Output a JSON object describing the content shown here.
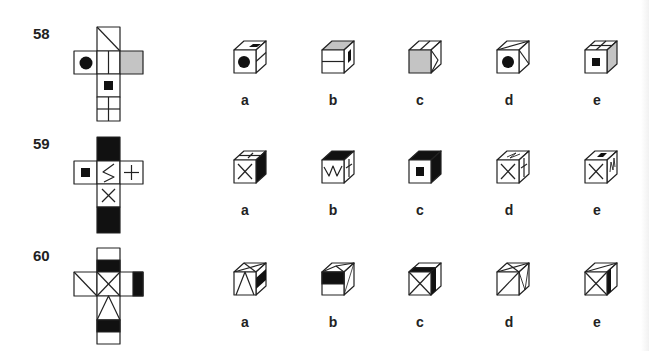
{
  "colors": {
    "line": "#222222",
    "black": "#111111",
    "gray": "#c4c4c4",
    "bg": "#ffffff"
  },
  "questions": [
    {
      "number": "58",
      "net": {
        "faces": [
          {
            "pos": "top",
            "pattern": "diagonal-tl-br"
          },
          {
            "pos": "left",
            "pattern": "black-circle"
          },
          {
            "pos": "center",
            "pattern": "vertical-split"
          },
          {
            "pos": "right",
            "pattern": "gray-fill"
          },
          {
            "pos": "below",
            "pattern": "black-square"
          },
          {
            "pos": "bottom",
            "pattern": "four-grid"
          }
        ]
      },
      "options": [
        {
          "label": "a",
          "front": "black-circle",
          "top": "black-square",
          "side": "horizontal-split"
        },
        {
          "label": "b",
          "front": "horizontal-split",
          "top": "gray-fill",
          "side": "black-square"
        },
        {
          "label": "c",
          "front": "gray-fill",
          "top": "vertical-split",
          "side": "diagonal-triangle"
        },
        {
          "label": "d",
          "front": "black-circle",
          "top": "diagonal",
          "side": "diagonal"
        },
        {
          "label": "e",
          "front": "black-square",
          "top": "vertical-split",
          "side": "gray-fill"
        }
      ]
    },
    {
      "number": "59",
      "net": {
        "faces": [
          {
            "pos": "top",
            "pattern": "black-fill"
          },
          {
            "pos": "left",
            "pattern": "black-square"
          },
          {
            "pos": "center",
            "pattern": "zigzag"
          },
          {
            "pos": "right",
            "pattern": "plus"
          },
          {
            "pos": "below",
            "pattern": "x-cross"
          },
          {
            "pos": "bottom",
            "pattern": "black-fill"
          }
        ]
      },
      "options": [
        {
          "label": "a",
          "front": "x-cross",
          "top": "plus",
          "side": "black-fill"
        },
        {
          "label": "b",
          "front": "zigzag",
          "top": "black-fill",
          "side": "plus"
        },
        {
          "label": "c",
          "front": "black-square",
          "top": "black-fill",
          "side": "black-fill"
        },
        {
          "label": "d",
          "front": "x-cross",
          "top": "zigzag",
          "side": "plus"
        },
        {
          "label": "e",
          "front": "x-cross",
          "top": "black-square",
          "side": "zigzag"
        }
      ]
    },
    {
      "number": "60",
      "net": {
        "faces": [
          {
            "pos": "top",
            "pattern": "black-lower-half"
          },
          {
            "pos": "left",
            "pattern": "diagonal-tl-br"
          },
          {
            "pos": "center",
            "pattern": "x-cross"
          },
          {
            "pos": "right",
            "pattern": "black-right-half"
          },
          {
            "pos": "below",
            "pattern": "triangle"
          },
          {
            "pos": "bottom",
            "pattern": "black-upper-half"
          }
        ]
      },
      "options": [
        {
          "label": "a",
          "front": "triangle",
          "top": "x-cross",
          "side": "black-mid"
        },
        {
          "label": "b",
          "front": "black-upper-half",
          "top": "triangle",
          "side": "diagonal"
        },
        {
          "label": "c",
          "front": "x-cross",
          "top": "black-front-half",
          "side": "black-left-strip"
        },
        {
          "label": "d",
          "front": "diagonal",
          "top": "x-cross",
          "side": "triangle"
        },
        {
          "label": "e",
          "front": "x-cross",
          "top": "diagonal",
          "side": "black-left-strip"
        }
      ]
    }
  ]
}
